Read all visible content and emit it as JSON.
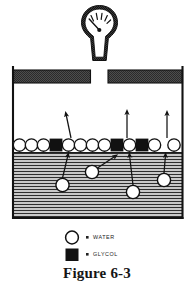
{
  "figure": {
    "caption": "Figure 6-3",
    "title_semantic": "evaporation-of-water-from-glycol-water-mixture"
  },
  "gauge": {
    "name": "pressure-gauge",
    "dial_tick_count": 5,
    "needle_angle_deg": 210
  },
  "container": {
    "name": "sealed-vessel",
    "wall_color": "#1a1a1a",
    "lid_fill": "#595959",
    "liquid_fill": "#c9c9c9",
    "liquid_hatch_color": "#2a2a2a"
  },
  "legend": {
    "items": [
      {
        "symbol": "open-circle",
        "label": "WATER",
        "color": "#ffffff"
      },
      {
        "symbol": "filled-square",
        "label": "GLYCOL",
        "color": "#111111"
      }
    ]
  },
  "surface_layer": {
    "name": "molecule-surface-row",
    "description": "alternating water circles and glycol squares at the liquid surface",
    "molecules": [
      {
        "type": "water",
        "cx": 19.5,
        "cy": 145
      },
      {
        "type": "water",
        "cx": 31.5,
        "cy": 145
      },
      {
        "type": "water",
        "cx": 43.5,
        "cy": 145
      },
      {
        "type": "glycol",
        "cx": 56.0,
        "cy": 145
      },
      {
        "type": "water",
        "cx": 68.5,
        "cy": 145
      },
      {
        "type": "water",
        "cx": 80.5,
        "cy": 145
      },
      {
        "type": "water",
        "cx": 92.5,
        "cy": 145
      },
      {
        "type": "water",
        "cx": 104.5,
        "cy": 145
      },
      {
        "type": "glycol",
        "cx": 117.0,
        "cy": 145
      },
      {
        "type": "water",
        "cx": 129.5,
        "cy": 145
      },
      {
        "type": "glycol",
        "cx": 142.0,
        "cy": 145
      },
      {
        "type": "water",
        "cx": 154.5,
        "cy": 145
      },
      {
        "type": "water",
        "cx": 174.0,
        "cy": 145
      }
    ]
  },
  "submerged_molecules": {
    "name": "rising-water-molecules",
    "items": [
      {
        "type": "water",
        "cx": 62.5,
        "cy": 185
      },
      {
        "type": "water",
        "cx": 92.0,
        "cy": 172
      },
      {
        "type": "water",
        "cx": 133.0,
        "cy": 192
      },
      {
        "type": "water",
        "cx": 164.0,
        "cy": 180
      }
    ]
  },
  "arrows": {
    "name": "motion-arrows",
    "escape_arrows": [
      {
        "x1": 71,
        "y1": 137,
        "x2": 66,
        "y2": 113
      },
      {
        "x1": 127,
        "y1": 137,
        "x2": 127,
        "y2": 111
      },
      {
        "x1": 167,
        "y1": 137,
        "x2": 167,
        "y2": 112
      }
    ],
    "rise_arrows": [
      {
        "x1": 62.5,
        "y1": 177,
        "x2": 68.5,
        "y2": 154
      },
      {
        "x1": 96.5,
        "y1": 168,
        "x2": 117.0,
        "y2": 154
      },
      {
        "x1": 133.0,
        "y1": 184,
        "x2": 129.5,
        "y2": 154
      },
      {
        "x1": 164.0,
        "y1": 172,
        "x2": 165.5,
        "y2": 154
      }
    ]
  },
  "measurements": {
    "vessel_left_x": 12,
    "vessel_right_x": 183,
    "vessel_bottom_y": 218,
    "liquid_top_y": 152,
    "lid_y": 70,
    "lid_height": 13
  }
}
